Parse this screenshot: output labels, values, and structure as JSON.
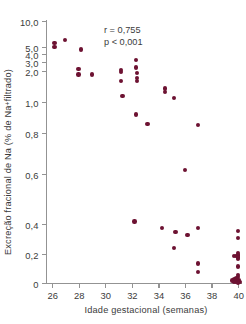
{
  "chart_data": {
    "type": "scatter",
    "title": "",
    "xlabel": "Idade gestacional (semanas)",
    "ylabel": "Excreção fracional de Na (% de Na+ filtrado)",
    "ylabel_prefix": "Excreção fracional de Na (% de Na",
    "ylabel_superscript": "+",
    "ylabel_suffix": " filtrado)",
    "xlim": [
      26,
      40
    ],
    "xticks": [
      26,
      28,
      30,
      32,
      34,
      36,
      38,
      40
    ],
    "xtick_labels": [
      "26",
      "28",
      "30",
      "32",
      "34",
      "36",
      "38",
      "40"
    ],
    "yticks": [
      0,
      0.2,
      0.4,
      0.6,
      0.8,
      1.0,
      2.0,
      3.0,
      4.0,
      5.0,
      10.0
    ],
    "ytick_labels": [
      "0",
      "0,2",
      "0,4",
      "0,6",
      "0,8",
      "1,0",
      "2,0",
      "3,0",
      "4,0",
      "5,0",
      "10,0"
    ],
    "yscale": "piecewise: linear 0-1,0 then logarithmic 1,0-10,0",
    "grid": false,
    "legend": null,
    "marker_color": "#6d1232",
    "axis_color": "#939393",
    "text_color": "#3b3b3b",
    "annotations": [
      {
        "name": "correlation-coefficient",
        "text": "r = 0,755"
      },
      {
        "name": "p-value",
        "text": "p < 0,001"
      }
    ],
    "annotation_lines": [
      "r = 0,755",
      "p < 0,001"
    ],
    "n_points": 52,
    "points": [
      {
        "x": 26.2,
        "y": 5.6
      },
      {
        "x": 26.2,
        "y": 5.0
      },
      {
        "x": 27.0,
        "y": 6.0
      },
      {
        "x": 28.2,
        "y": 4.6
      },
      {
        "x": 28.0,
        "y": 2.2
      },
      {
        "x": 28.0,
        "y": 1.85
      },
      {
        "x": 29.0,
        "y": 1.85
      },
      {
        "x": 31.2,
        "y": 2.1
      },
      {
        "x": 31.2,
        "y": 1.95
      },
      {
        "x": 31.2,
        "y": 1.6
      },
      {
        "x": 31.3,
        "y": 1.15
      },
      {
        "x": 32.3,
        "y": 3.2
      },
      {
        "x": 32.3,
        "y": 2.35
      },
      {
        "x": 32.4,
        "y": 1.9
      },
      {
        "x": 32.4,
        "y": 1.72
      },
      {
        "x": 32.4,
        "y": 1.6
      },
      {
        "x": 34.5,
        "y": 1.35
      },
      {
        "x": 34.5,
        "y": 1.25
      },
      {
        "x": 35.2,
        "y": 1.1
      },
      {
        "x": 32.3,
        "y": 0.92
      },
      {
        "x": 33.2,
        "y": 0.86
      },
      {
        "x": 37.0,
        "y": 0.85
      },
      {
        "x": 36.0,
        "y": 0.62
      },
      {
        "x": 32.2,
        "y": 0.41
      },
      {
        "x": 34.3,
        "y": 0.375
      },
      {
        "x": 37.0,
        "y": 0.375
      },
      {
        "x": 35.3,
        "y": 0.345
      },
      {
        "x": 36.2,
        "y": 0.325
      },
      {
        "x": 40.0,
        "y": 0.355
      },
      {
        "x": 40.0,
        "y": 0.305
      },
      {
        "x": 35.2,
        "y": 0.24
      },
      {
        "x": 40.0,
        "y": 0.205
      },
      {
        "x": 40.0,
        "y": 0.195
      },
      {
        "x": 40.0,
        "y": 0.19
      },
      {
        "x": 39.85,
        "y": 0.185
      },
      {
        "x": 39.7,
        "y": 0.185
      },
      {
        "x": 40.0,
        "y": 0.175
      },
      {
        "x": 40.0,
        "y": 0.165
      },
      {
        "x": 37.0,
        "y": 0.135
      },
      {
        "x": 40.0,
        "y": 0.115
      },
      {
        "x": 37.0,
        "y": 0.075
      },
      {
        "x": 40.0,
        "y": 0.055
      },
      {
        "x": 40.0,
        "y": 0.04
      },
      {
        "x": 39.9,
        "y": 0.03
      },
      {
        "x": 39.75,
        "y": 0.025
      },
      {
        "x": 40.05,
        "y": 0.02
      },
      {
        "x": 39.6,
        "y": 0.018
      },
      {
        "x": 40.0,
        "y": 0.012
      },
      {
        "x": 39.85,
        "y": 0.01
      },
      {
        "x": 40.1,
        "y": 0.008
      },
      {
        "x": 39.7,
        "y": 0.006
      },
      {
        "x": 40.0,
        "y": 0.004
      }
    ]
  }
}
